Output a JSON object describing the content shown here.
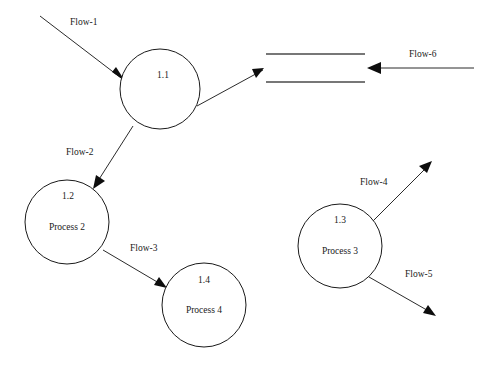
{
  "diagram": {
    "type": "data-flow-diagram",
    "background_color": "#ffffff",
    "line_color": "#2b2b2b",
    "text_color": "#1a1a1a",
    "width": 497,
    "height": 373
  },
  "processes": [
    {
      "id": "p11",
      "number": "1.1",
      "name": "",
      "cx": 160,
      "cy": 89,
      "r": 40
    },
    {
      "id": "p12",
      "number": "1.2",
      "name": "Process 2",
      "cx": 67,
      "cy": 222,
      "r": 42
    },
    {
      "id": "p14",
      "number": "1.4",
      "name": "Process 4",
      "cx": 204,
      "cy": 305,
      "r": 42
    },
    {
      "id": "p13",
      "number": "1.3",
      "name": "Process 3",
      "cx": 340,
      "cy": 246,
      "r": 42
    }
  ],
  "data_stores": [
    {
      "id": "ds1",
      "label": "",
      "x1": 266,
      "x2": 365,
      "top_y": 54,
      "bottom_y": 82
    }
  ],
  "flows": [
    {
      "id": "flow1",
      "label": "Flow-1",
      "label_x": 70,
      "label_y": 25,
      "x1": 40,
      "y1": 16,
      "x2": 125,
      "y2": 81
    },
    {
      "id": "flow_store_in",
      "label": "",
      "label_x": 0,
      "label_y": 0,
      "x1": 197,
      "y1": 106,
      "x2": 263,
      "y2": 70
    },
    {
      "id": "flow6",
      "label": "Flow-6",
      "label_x": 409,
      "label_y": 57,
      "x1": 474,
      "y1": 68,
      "x2": 370,
      "y2": 68
    },
    {
      "id": "flow2",
      "label": "Flow-2",
      "label_x": 66,
      "label_y": 155,
      "x1": 133,
      "y1": 126,
      "x2": 94,
      "y2": 186
    },
    {
      "id": "flow3",
      "label": "Flow-3",
      "label_x": 130,
      "label_y": 251,
      "x1": 103,
      "y1": 250,
      "x2": 166,
      "y2": 287
    },
    {
      "id": "flow4",
      "label": "Flow-4",
      "label_x": 360,
      "label_y": 185,
      "x1": 372,
      "y1": 222,
      "x2": 431,
      "y2": 162
    },
    {
      "id": "flow5",
      "label": "Flow-5",
      "label_x": 405,
      "label_y": 277,
      "x1": 369,
      "y1": 277,
      "x2": 435,
      "y2": 315
    }
  ]
}
